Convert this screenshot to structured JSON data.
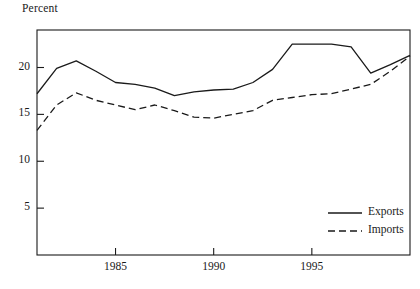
{
  "chart_data": {
    "type": "line",
    "title": "",
    "ylabel": "Percent",
    "xlabel": "",
    "ylim": [
      0,
      24
    ],
    "xlim": [
      1981,
      2000
    ],
    "grid": false,
    "yticks": [
      5,
      10,
      15,
      20
    ],
    "ytick_labels": [
      "5",
      "10",
      "15",
      "20"
    ],
    "xticks": [
      1985,
      1990,
      1995
    ],
    "xtick_labels": [
      "1985",
      "1990",
      "1995"
    ],
    "legend_position": "lower-right-inside",
    "x": [
      1981,
      1982,
      1983,
      1984,
      1985,
      1986,
      1987,
      1988,
      1989,
      1990,
      1991,
      1992,
      1993,
      1994,
      1995,
      1996,
      1997,
      1998,
      1999,
      2000
    ],
    "series": [
      {
        "name": "Exports",
        "style": "solid",
        "color": "#1a1a1a",
        "values": [
          17.2,
          19.9,
          20.7,
          19.6,
          18.4,
          18.2,
          17.8,
          17.0,
          17.4,
          17.6,
          17.7,
          18.4,
          19.8,
          22.5,
          22.5,
          22.5,
          22.2,
          19.4,
          20.3,
          21.3
        ]
      },
      {
        "name": "Imports",
        "style": "dashed",
        "color": "#1a1a1a",
        "values": [
          13.3,
          16.0,
          17.3,
          16.5,
          16.0,
          15.5,
          16.0,
          15.4,
          14.7,
          14.6,
          15.0,
          15.4,
          16.5,
          16.8,
          17.1,
          17.2,
          17.7,
          18.2,
          19.6,
          21.2
        ]
      }
    ],
    "legend": [
      {
        "label": "Exports",
        "style": "solid"
      },
      {
        "label": "Imports",
        "style": "dashed"
      }
    ]
  }
}
